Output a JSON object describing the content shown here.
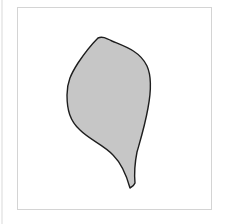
{
  "figure": {
    "shape": {
      "name": "leaf-shape",
      "fill": "#c6c6c6",
      "stroke": "#1e1e1e",
      "stroke_width": 1.4,
      "path": "M98,38 C102,36 106,38 112,41 C124,46 140,51 147,66 C152,77 151,92 148,108 C145,125 141,138 137,152 C135,162 134,172 135,183 C134,186 132,187 130,188 C127,177 122,164 113,155 C104,145 90,140 80,130 C70,121 67,110 67,95 C67,82 71,74 78,63 C84,54 91,45 98,38 Z"
    },
    "frame": {
      "border_color": "#d4d4d4",
      "background": "#ffffff"
    }
  }
}
